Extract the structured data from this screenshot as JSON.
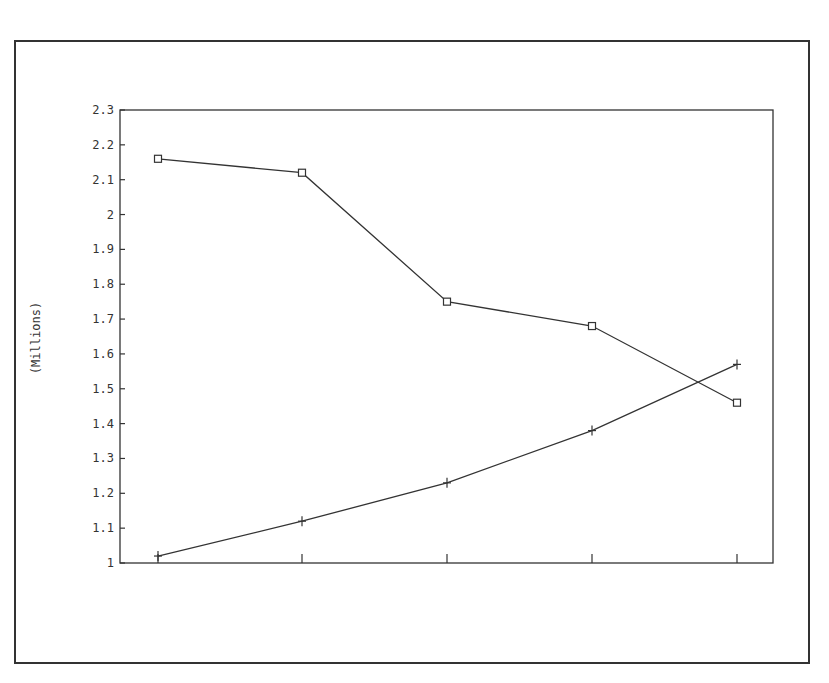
{
  "chart_data": {
    "type": "line",
    "title": "",
    "xlabel": "",
    "ylabel": "(Millions)",
    "categories": [
      "",
      "",
      "",
      "",
      ""
    ],
    "x": [
      1,
      2,
      3,
      4,
      5
    ],
    "ylim": [
      1,
      2.3
    ],
    "yticks": [
      1,
      1.1,
      1.2,
      1.3,
      1.4,
      1.5,
      1.6,
      1.7,
      1.8,
      1.9,
      2,
      2.1,
      2.2,
      2.3
    ],
    "ytick_labels": [
      "1",
      "1.1",
      "1.2",
      "1.3",
      "1.4",
      "1.5",
      "1.6",
      "1.7",
      "1.8",
      "1.9",
      "2",
      "2.1",
      "2.2",
      "2.3"
    ],
    "grid": false,
    "legend": null,
    "series": [
      {
        "name": "Series 1 (square markers)",
        "marker": "square",
        "values": [
          2.16,
          2.12,
          1.75,
          1.68,
          1.46
        ]
      },
      {
        "name": "Series 2 (plus markers)",
        "marker": "plus",
        "values": [
          1.02,
          1.12,
          1.23,
          1.38,
          1.57
        ]
      }
    ]
  },
  "layout": {
    "plot": {
      "left": 120,
      "right": 773,
      "top": 110,
      "bottom": 563
    },
    "x_positions": [
      158,
      302,
      447,
      592,
      737
    ],
    "line_color": "#333333"
  },
  "caption": {
    "text": ""
  }
}
